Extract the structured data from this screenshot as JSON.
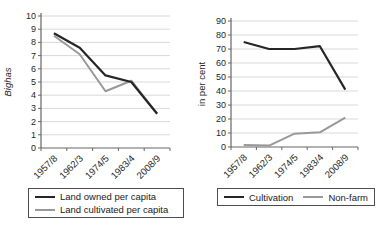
{
  "style": {
    "background": "#ffffff",
    "axis_color": "#666666",
    "grid_color": "#d9d9d9",
    "text_color": "#262626",
    "legend_border_color": "#4d4d4d"
  },
  "chart_data": [
    {
      "type": "line",
      "title": "",
      "ylabel": "Bighas",
      "ylabel_italic": true,
      "ylim": [
        0,
        10
      ],
      "ytick_step": 1,
      "grid": true,
      "legend_position": "bottom",
      "legend_layout": "vertical",
      "categories": [
        "1957/8",
        "1962/3",
        "1974/5",
        "1983/4",
        "2008/9"
      ],
      "series": [
        {
          "name": "Land owned per capita",
          "color": "#262626",
          "values": [
            8.7,
            7.6,
            5.5,
            5.0,
            2.6
          ]
        },
        {
          "name": "Land cultivated per capita",
          "color": "#999999",
          "values": [
            8.5,
            7.1,
            4.3,
            5.1,
            2.6
          ]
        }
      ]
    },
    {
      "type": "line",
      "title": "",
      "ylabel": "in per cent",
      "ylabel_italic": false,
      "ylim": [
        0,
        90
      ],
      "ytick_step": 10,
      "grid": true,
      "legend_position": "bottom",
      "legend_layout": "horizontal",
      "categories": [
        "1957/8",
        "1962/3",
        "1974/5",
        "1983/4",
        "2008/9"
      ],
      "series": [
        {
          "name": "Cultivation",
          "color": "#262626",
          "values": [
            75,
            70,
            70,
            72,
            41
          ]
        },
        {
          "name": "Non-farm",
          "color": "#999999",
          "values": [
            1.5,
            1,
            9.5,
            10.5,
            21
          ]
        }
      ]
    }
  ]
}
